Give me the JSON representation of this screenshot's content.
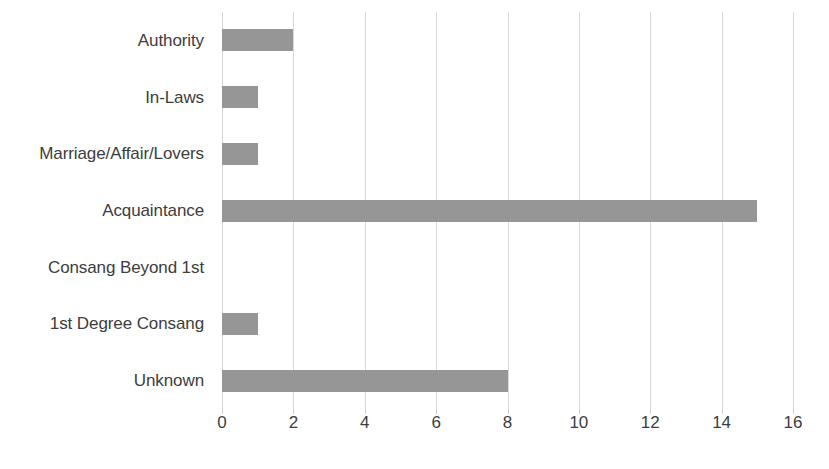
{
  "chart_data": {
    "type": "bar",
    "orientation": "horizontal",
    "title": "",
    "subtitle": "",
    "xlabel": "",
    "ylabel": "",
    "categories": [
      "Authority",
      "In-Laws",
      "Marriage/Affair/Lovers",
      "Acquaintance",
      "Consang Beyond 1st",
      "1st Degree Consang",
      "Unknown"
    ],
    "values": [
      2,
      1,
      1,
      15,
      0,
      1,
      8
    ],
    "xlim": [
      0,
      16
    ],
    "xticks": [
      0,
      2,
      4,
      6,
      8,
      10,
      12,
      14,
      16
    ],
    "xtick_labels": [
      "0",
      "2",
      "4",
      "6",
      "8",
      "10",
      "12",
      "14",
      "16"
    ],
    "grid": "vertical",
    "legend": null,
    "legend_position": "none",
    "annotations": [],
    "colors": {
      "bar": "#969696",
      "gridline": "#d9d9d9",
      "axis": "#d4d4d4",
      "text": "#3d3d3d",
      "background": "#ffffff"
    }
  }
}
